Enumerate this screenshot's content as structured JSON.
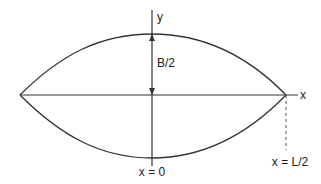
{
  "diagram": {
    "title": "",
    "labels": {
      "y_axis": "y",
      "x_axis": "x",
      "half_width": "B/2",
      "origin": "x = 0",
      "half_length": "x = L/2"
    },
    "colors": {
      "line": "#333333",
      "text": "#222222",
      "background": "#ffffff"
    }
  }
}
